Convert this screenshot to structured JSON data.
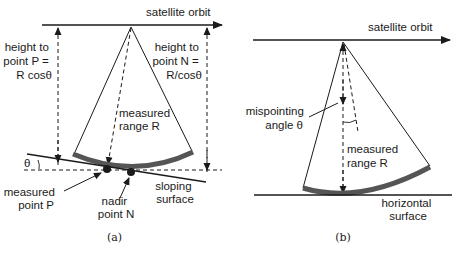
{
  "panel_a": {
    "orbit_label": "satellite orbit",
    "height_p_label": [
      "height to",
      "point P =",
      "R cosθ"
    ],
    "height_n_label": [
      "height to",
      "point N =",
      "R/cosθ"
    ],
    "range_label": [
      "measured",
      "range R"
    ],
    "theta_label": "θ",
    "point_p_label": [
      "measured",
      "point P"
    ],
    "point_n_label": [
      "nadir",
      "point N"
    ],
    "surface_label": [
      "sloping",
      "surface"
    ],
    "caption": "(a)"
  },
  "panel_b": {
    "orbit_label": "satellite orbit",
    "mispointing_label": [
      "mispointing",
      "angle θ"
    ],
    "range_label": [
      "measured",
      "range R"
    ],
    "surface_label": [
      "horizontal",
      "surface"
    ],
    "caption": "(b)"
  },
  "colors": {
    "line": "#1a1a1a",
    "footprint": "#555555",
    "background": "#ffffff"
  }
}
